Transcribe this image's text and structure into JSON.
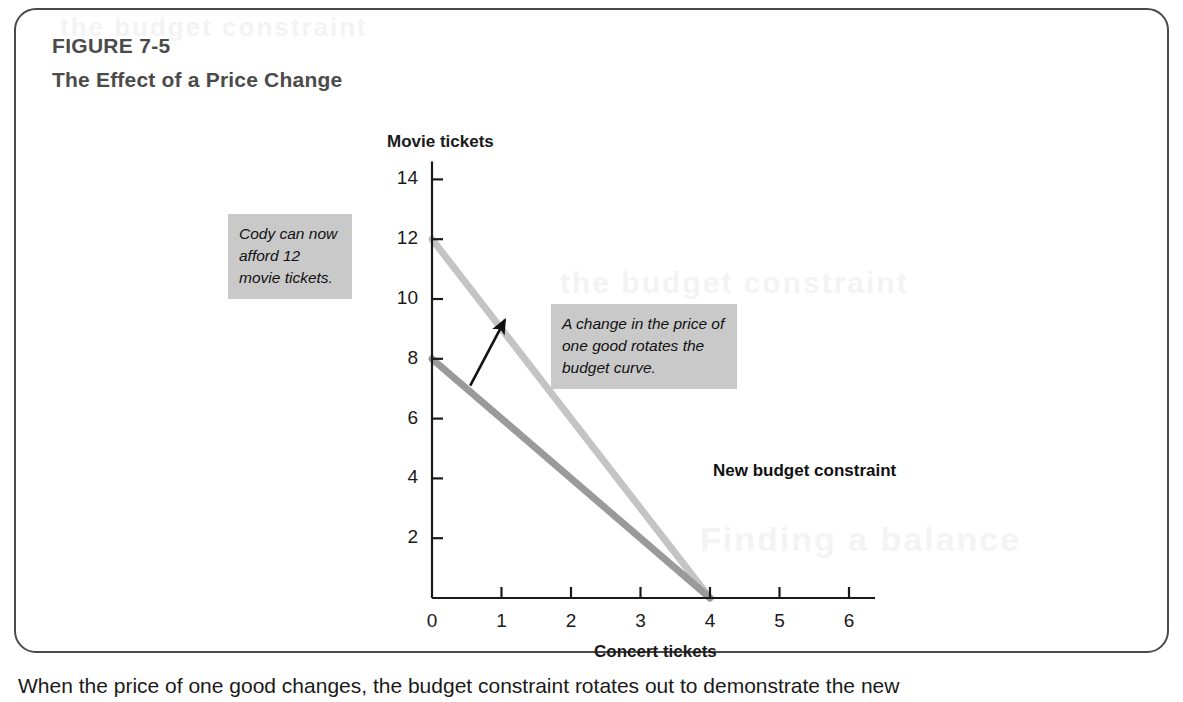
{
  "figure": {
    "number": "FIGURE 7-5",
    "title": "The Effect of a Price Change",
    "border_color": "#4a4a4a",
    "heading_color": "#4b4b4b"
  },
  "annotations": {
    "cody": "Cody can now afford 12 movie tickets.",
    "rotate": "A change in the price of one good rotates the budget curve.",
    "new_budget_constraint": "New budget constraint",
    "callout_background": "#c9c9c9"
  },
  "caption": "When the price of one good changes, the budget constraint rotates out to demonstrate the new",
  "chart_data": {
    "type": "line",
    "title": "The Effect of a Price Change",
    "xlabel": "Concert tickets",
    "ylabel": "Movie tickets",
    "xlim": [
      0,
      6
    ],
    "ylim": [
      0,
      14
    ],
    "xticks": [
      0,
      1,
      2,
      3,
      4,
      5,
      6
    ],
    "yticks": [
      0,
      2,
      4,
      6,
      8,
      10,
      12,
      14
    ],
    "ytick_labels": [
      "2",
      "4",
      "6",
      "8",
      "10",
      "12",
      "14"
    ],
    "origin_label": "0",
    "grid": false,
    "legend": "none",
    "series": [
      {
        "name": "Original budget constraint",
        "color": "#9a9a9a",
        "x": [
          0,
          4
        ],
        "y": [
          8,
          0
        ],
        "points": [
          [
            0,
            8
          ],
          [
            4,
            0
          ]
        ]
      },
      {
        "name": "New budget constraint",
        "color": "#c4c4c4",
        "x": [
          0,
          4
        ],
        "y": [
          12,
          0
        ],
        "points": [
          [
            0,
            12
          ],
          [
            4,
            0
          ]
        ]
      }
    ],
    "annotations": [
      {
        "name": "rotation-arrow",
        "type": "arrow",
        "from": [
          0.55,
          7.1
        ],
        "to": [
          1.05,
          9.3
        ],
        "color": "#111111"
      },
      {
        "name": "cody-callout",
        "text": "Cody can now afford 12 movie tickets."
      },
      {
        "name": "rotate-callout",
        "text": "A change in the price of one good rotates the budget curve."
      },
      {
        "name": "new-budget-constraint-label",
        "text": "New budget constraint"
      }
    ]
  },
  "bleed_text": {
    "line1": "the budget constraint",
    "line2": "and spending",
    "line3": "Finding a balance"
  }
}
